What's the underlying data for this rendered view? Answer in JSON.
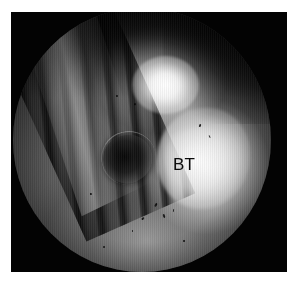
{
  "figure": {
    "kind": "arthroscopic-endoscopic-photograph",
    "modality_label": "Arthroscopic view",
    "frame": {
      "background_color": "#ffffff",
      "photo_border_color": "#030303",
      "left": 11,
      "top": 12,
      "width": 276,
      "height": 260
    },
    "field_of_view": {
      "shape": "circular",
      "diameter_px": 260,
      "vignette": "dark"
    }
  },
  "annotations": [
    {
      "id": "bt",
      "text": "BT",
      "meaning": "bone tunnel",
      "color": "#0a0a0a",
      "left_pct": 62,
      "top_pct": 56
    }
  ],
  "structures": [
    {
      "name": "ridged-instrument",
      "position": "left",
      "appearance": "dark striated diagonal bands"
    },
    {
      "name": "specular-highlight",
      "position": "upper-center",
      "appearance": "bright white glare"
    },
    {
      "name": "dark-cavity",
      "position": "center-left",
      "appearance": "dark oval opening"
    },
    {
      "name": "bright-tissue",
      "position": "right",
      "appearance": "bright white-gray mass"
    },
    {
      "name": "tissue-floor",
      "position": "bottom",
      "appearance": "mid-gray speckled surface"
    }
  ],
  "specks": [
    {
      "left_pct": 55,
      "top_pct": 74,
      "w": 2.2,
      "h": 3.6,
      "rot": 28
    },
    {
      "left_pct": 58,
      "top_pct": 78,
      "w": 1.8,
      "h": 4.0,
      "rot": -18
    },
    {
      "left_pct": 50,
      "top_pct": 79,
      "w": 1.6,
      "h": 2.8,
      "rot": 42
    },
    {
      "left_pct": 62,
      "top_pct": 76,
      "w": 1.4,
      "h": 3.0,
      "rot": 10
    },
    {
      "left_pct": 46,
      "top_pct": 84,
      "w": 1.6,
      "h": 2.2,
      "rot": 0
    },
    {
      "left_pct": 72,
      "top_pct": 44,
      "w": 1.6,
      "h": 3.2,
      "rot": 20
    },
    {
      "left_pct": 76,
      "top_pct": 48,
      "w": 1.4,
      "h": 2.6,
      "rot": -24
    },
    {
      "left_pct": 40,
      "top_pct": 33,
      "w": 1.8,
      "h": 2.0,
      "rot": 0
    },
    {
      "left_pct": 47,
      "top_pct": 36,
      "w": 1.6,
      "h": 2.4,
      "rot": 34
    },
    {
      "left_pct": 35,
      "top_pct": 90,
      "w": 2.0,
      "h": 2.0,
      "rot": 0
    },
    {
      "left_pct": 30,
      "top_pct": 70,
      "w": 1.8,
      "h": 2.4,
      "rot": -12
    },
    {
      "left_pct": 66,
      "top_pct": 88,
      "w": 1.6,
      "h": 1.8,
      "rot": 0
    }
  ]
}
